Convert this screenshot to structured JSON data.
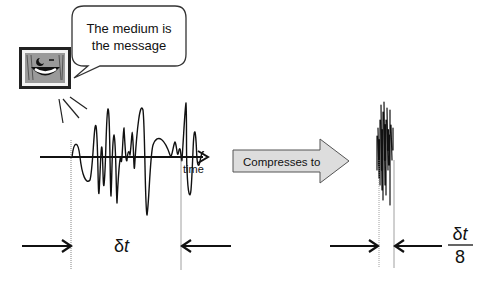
{
  "speech_bubble": {
    "line1": "The medium is",
    "line2": "the message"
  },
  "left_signal": {
    "axis_label": "time",
    "duration_label": "δt"
  },
  "transform_arrow": {
    "label": "Compresses to",
    "fill": "#dddddd"
  },
  "right_signal": {
    "duration_numerator": "δt",
    "duration_denominator": "8"
  },
  "icons": {
    "tv": "smiling-tv-icon"
  }
}
